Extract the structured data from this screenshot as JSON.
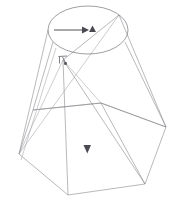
{
  "figure": {
    "background_color": "#ffffff",
    "line_color": "#8a8a8f",
    "marker_color": "#4a4a52",
    "width": 173,
    "height": 207
  },
  "geometry": {
    "top_ellipse": {
      "name": "top-circular-opening",
      "center_x": 88,
      "center_y": 30,
      "radius_x": 40,
      "radius_y": 24
    },
    "apex_point": {
      "name": "interior-apex-node",
      "x": 63,
      "y": 60
    },
    "top_right_node": {
      "name": "top-right-convergence-node",
      "x": 119,
      "y": 15
    },
    "bottom_polygon": {
      "name": "bottom-hexagon",
      "points": "19,154 33,110 101,103 166,127 145,184 68,195"
    },
    "mid_polygon": {
      "name": "mid-section-hexagon",
      "points": "33,110 101,103 166,127 145,184 68,195 19,154"
    },
    "upper_rim": {
      "name": "upper-rim-polyline",
      "points": "33,110 101,103 166,127"
    },
    "edges": [
      {
        "name": "edge-left-outer",
        "x1": 48,
        "y1": 30,
        "x2": 19,
        "y2": 154
      },
      {
        "name": "edge-left-inner",
        "x1": 52,
        "y1": 40,
        "x2": 33,
        "y2": 110
      },
      {
        "name": "edge-right-outer",
        "x1": 124,
        "y1": 40,
        "x2": 166,
        "y2": 127
      },
      {
        "name": "edge-right-upper",
        "x1": 119,
        "y1": 15,
        "x2": 166,
        "y2": 127
      },
      {
        "name": "edge-apex-to-bottom",
        "x1": 63,
        "y1": 60,
        "x2": 68,
        "y2": 195
      },
      {
        "name": "edge-apex-to-right",
        "x1": 63,
        "y1": 60,
        "x2": 145,
        "y2": 184
      },
      {
        "name": "edge-node-to-left",
        "x1": 119,
        "y1": 15,
        "x2": 19,
        "y2": 154
      },
      {
        "name": "edge-node-to-apexregion",
        "x1": 119,
        "y1": 15,
        "x2": 63,
        "y2": 60
      },
      {
        "name": "edge-apex-to-toprim",
        "x1": 63,
        "y1": 60,
        "x2": 101,
        "y2": 103
      },
      {
        "name": "edge-vertical-mid",
        "x1": 101,
        "y1": 103,
        "x2": 145,
        "y2": 184
      }
    ]
  },
  "annotations": {
    "top_arrow": {
      "name": "horizontal-flow-arrow",
      "label": "",
      "start_x": 54,
      "start_y": 30,
      "end_x": 84,
      "end_y": 30,
      "direction": "right"
    },
    "top_cone_marker": {
      "name": "upward-cone-marker",
      "x": 90,
      "y": 30,
      "direction": "up"
    },
    "bottom_cone_marker": {
      "name": "downward-cone-marker",
      "x": 87,
      "y": 151,
      "direction": "down"
    },
    "apex_marker": {
      "name": "apex-angle-marker",
      "x": 63,
      "y": 60,
      "description": "small bracket and square node at interior apex"
    }
  }
}
